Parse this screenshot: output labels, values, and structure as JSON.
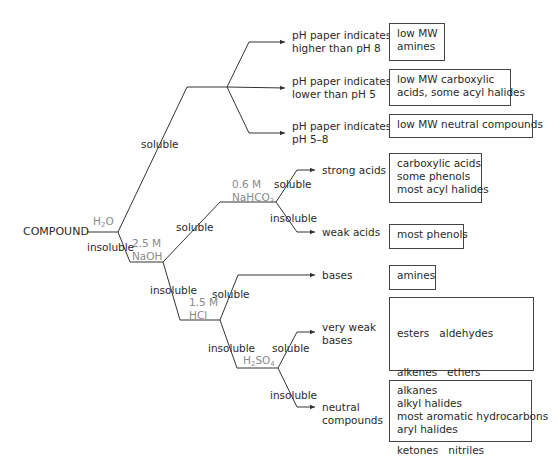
{
  "diagram": {
    "root": "COMPOUND",
    "reagents": {
      "water": {
        "base": "H",
        "sub": "2",
        "tail": "O"
      },
      "naoh": {
        "line1": "2.5 M",
        "line2": "NaOH"
      },
      "nahco3": {
        "line1": "0.6 M",
        "line2_base": "NaHCO",
        "line2_sub": "3"
      },
      "hcl": {
        "line1": "1.5 M",
        "line2": "HCl"
      },
      "h2so4": {
        "base1": "H",
        "sub1": "2",
        "base2": "SO",
        "sub2": "4"
      }
    },
    "branch_labels": {
      "water_soluble": "soluble",
      "water_insoluble": "insoluble",
      "naoh_soluble": "soluble",
      "naoh_insoluble": "insoluble",
      "nahco3_soluble": "soluble",
      "nahco3_insoluble": "insoluble",
      "hcl_soluble": "soluble",
      "hcl_insoluble": "insoluble",
      "h2so4_soluble": "soluble",
      "h2so4_insoluble": "insoluble"
    },
    "outcomes": [
      {
        "id": "ph-high",
        "label_lines": [
          "pH paper indicates",
          "higher than pH 8"
        ],
        "box": [
          "low MW",
          "amines"
        ]
      },
      {
        "id": "ph-low",
        "label_lines": [
          "pH paper indicates",
          "lower than pH 5"
        ],
        "box": [
          "low MW carboxylic",
          "acids, some acyl halides"
        ]
      },
      {
        "id": "ph-neutral",
        "label_lines": [
          "pH paper indicates",
          "pH 5–8"
        ],
        "box": [
          "low MW neutral compounds"
        ]
      },
      {
        "id": "strong-acids",
        "label_lines": [
          "strong acids"
        ],
        "box": [
          "carboxylic acids",
          "some phenols",
          "most acyl halides"
        ]
      },
      {
        "id": "weak-acids",
        "label_lines": [
          "weak acids"
        ],
        "box": [
          "most phenols"
        ]
      },
      {
        "id": "bases",
        "label_lines": [
          "bases"
        ],
        "box": [
          "amines"
        ]
      },
      {
        "id": "very-weak-bases",
        "label_lines": [
          "very weak",
          "bases"
        ],
        "box": [
          "esters   aldehydes",
          "alkenes   ethers",
          "alcohols   amides",
          "ketones   nitriles",
          "some aromatic hydrocarbons"
        ]
      },
      {
        "id": "neutral-compounds",
        "label_lines": [
          "neutral",
          "compounds"
        ],
        "box": [
          "alkanes",
          "alkyl halides",
          "most aromatic hydrocarbons",
          "aryl halides"
        ]
      }
    ],
    "colors": {
      "line": "#333333",
      "reagent_text": "#8a8a8a",
      "text": "#2a2a2a"
    }
  }
}
